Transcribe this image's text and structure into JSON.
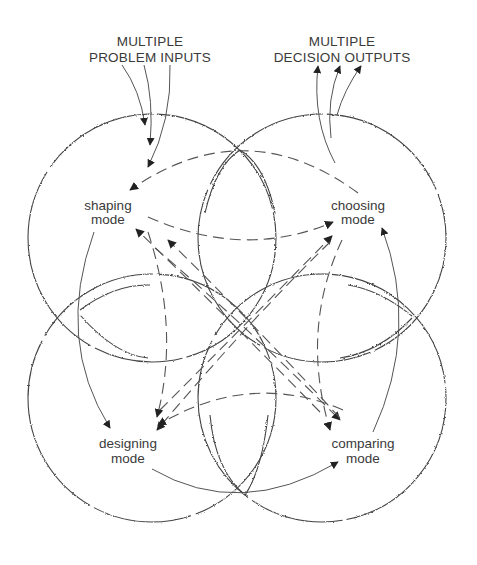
{
  "diagram": {
    "inputs_label": {
      "line1": "MULTIPLE",
      "line2": "PROBLEM INPUTS"
    },
    "outputs_label": {
      "line1": "MULTIPLE",
      "line2": "DECISION OUTPUTS"
    },
    "modes": [
      {
        "id": "shaping",
        "line1": "shaping",
        "line2": "mode"
      },
      {
        "id": "choosing",
        "line1": "choosing",
        "line2": "mode"
      },
      {
        "id": "designing",
        "line1": "designing",
        "line2": "mode"
      },
      {
        "id": "comparing",
        "line1": "comparing",
        "line2": "mode"
      }
    ],
    "connections": {
      "solid": [
        {
          "from": "shaping",
          "to": "designing"
        },
        {
          "from": "designing",
          "to": "comparing"
        },
        {
          "from": "comparing",
          "to": "choosing"
        }
      ],
      "dashed": [
        {
          "from": "choosing",
          "to": "shaping"
        },
        {
          "from": "shaping",
          "to": "choosing"
        },
        {
          "from": "shaping",
          "to": "comparing"
        },
        {
          "from": "comparing",
          "to": "shaping"
        },
        {
          "from": "designing",
          "to": "choosing"
        },
        {
          "from": "choosing",
          "to": "designing"
        },
        {
          "from": "comparing",
          "to": "designing"
        },
        {
          "from": "designing",
          "to": "shaping"
        },
        {
          "from": "choosing",
          "to": "comparing"
        }
      ]
    },
    "input_arrow_count": 3,
    "output_arrow_count": 3
  }
}
